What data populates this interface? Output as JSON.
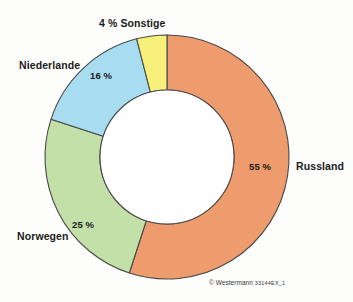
{
  "chart_data": {
    "type": "pie",
    "variant": "donut",
    "title": "",
    "subtitle": "",
    "xlabel": "",
    "ylabel": "",
    "grid": false,
    "legend_position": "outside-labels",
    "start_angle_deg": 0,
    "direction": "clockwise",
    "unit": "%",
    "categories": [
      "Russland",
      "Norwegen",
      "Niederlande",
      "Sonstige"
    ],
    "values": [
      55,
      25,
      16,
      4
    ],
    "value_labels": [
      "55 %",
      "25 %",
      "16 %",
      "4 %"
    ],
    "colors": [
      "#EE9B6E",
      "#C2E0A8",
      "#A8DCF0",
      "#F7F07A"
    ],
    "slices": [
      {
        "name": "Russland",
        "value": 55,
        "value_label": "55 %",
        "color": "#EE9B6E",
        "start_pct": 0,
        "end_pct": 55
      },
      {
        "name": "Norwegen",
        "value": 25,
        "value_label": "25 %",
        "color": "#C2E0A8",
        "start_pct": 55,
        "end_pct": 80
      },
      {
        "name": "Niederlande",
        "value": 16,
        "value_label": "16 %",
        "color": "#A8DCF0",
        "start_pct": 80,
        "end_pct": 96
      },
      {
        "name": "Sonstige",
        "value": 4,
        "value_label": "4 %",
        "color": "#F7F07A",
        "start_pct": 96,
        "end_pct": 100
      }
    ],
    "annotations": {
      "sonstige_combined": "4 % Sonstige"
    }
  },
  "labels": {
    "sonstige": "4 % Sonstige",
    "niederlande": "Niederlande",
    "niederlande_value": "16 %",
    "norwegen": "Norwegen",
    "norwegen_value": "25 %",
    "russland": "Russland",
    "russland_value": "55 %"
  },
  "footer": {
    "copyright": "© Westermann",
    "code": "33144EX_1"
  },
  "style": {
    "background": "#fdfdfb",
    "stroke": "#4a4a4a",
    "text": "#1b1b1b",
    "orange": "#EE9B6E",
    "green": "#C2E0A8",
    "blue": "#A8DCF0",
    "yellow": "#F7F07A",
    "hole": "#ffffff"
  }
}
